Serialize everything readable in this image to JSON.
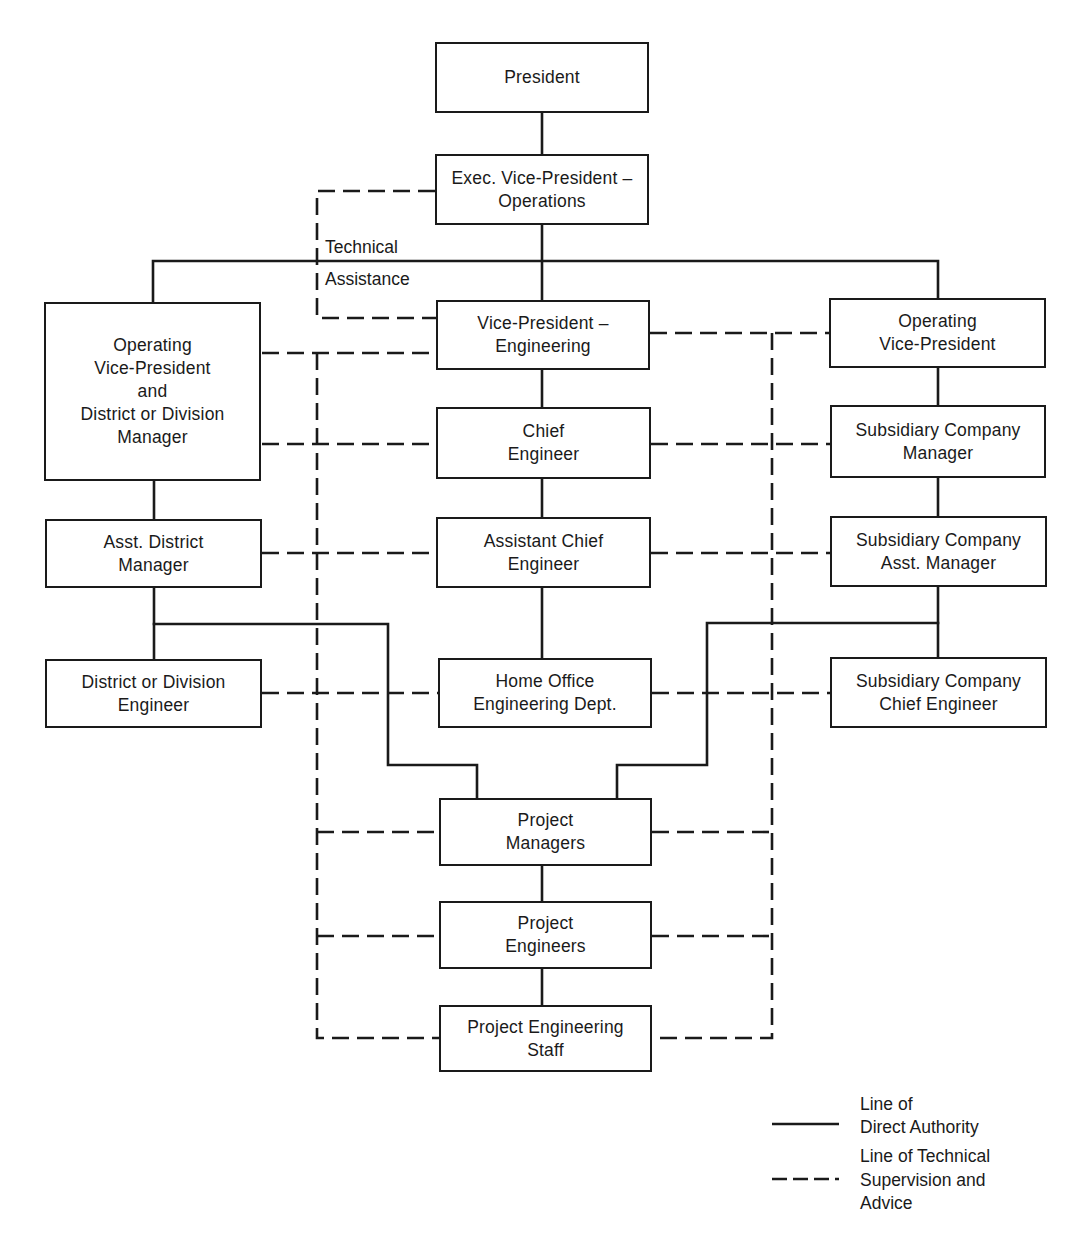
{
  "diagram": {
    "type": "organization-chart",
    "boxes": {
      "president": {
        "lines": [
          "President"
        ]
      },
      "exec_vp_operations": {
        "lines": [
          "Exec. Vice-President –",
          "Operations"
        ]
      },
      "vp_engineering": {
        "lines": [
          "Vice-President –",
          "Engineering"
        ]
      },
      "chief_engineer": {
        "lines": [
          "Chief",
          "Engineer"
        ]
      },
      "assistant_chief_engineer": {
        "lines": [
          "Assistant Chief",
          "Engineer"
        ]
      },
      "home_office_engineering": {
        "lines": [
          "Home Office",
          "Engineering Dept."
        ]
      },
      "project_managers": {
        "lines": [
          "Project",
          "Managers"
        ]
      },
      "project_engineers": {
        "lines": [
          "Project",
          "Engineers"
        ]
      },
      "project_engineering_staff": {
        "lines": [
          "Project Engineering",
          "Staff"
        ]
      },
      "operating_vp_district_manager": {
        "lines": [
          "Operating",
          "Vice-President",
          "and",
          "District or Division",
          "Manager"
        ]
      },
      "asst_district_manager": {
        "lines": [
          "Asst. District",
          "Manager"
        ]
      },
      "district_division_engineer": {
        "lines": [
          "District or Division",
          "Engineer"
        ]
      },
      "operating_vp": {
        "lines": [
          "Operating",
          "Vice-President"
        ]
      },
      "subsidiary_company_manager": {
        "lines": [
          "Subsidiary Company",
          "Manager"
        ]
      },
      "subsidiary_company_asst_manager": {
        "lines": [
          "Subsidiary Company",
          "Asst. Manager"
        ]
      },
      "subsidiary_company_chief_engineer": {
        "lines": [
          "Subsidiary Company",
          "Chief Engineer"
        ]
      }
    },
    "annotations": {
      "technical_assistance": [
        "Technical",
        "Assistance"
      ]
    },
    "legend": {
      "direct_authority": {
        "lines": [
          "Line of",
          "Direct Authority"
        ],
        "style": "solid"
      },
      "technical_supervision": {
        "lines": [
          "Line of Technical",
          "Supervision and",
          "Advice"
        ],
        "style": "dashed"
      }
    },
    "colors": {
      "line": "#1a1a1a",
      "background": "#ffffff"
    },
    "direct_authority_links": [
      [
        "President",
        "Exec. Vice-President – Operations"
      ],
      [
        "Exec. Vice-President – Operations",
        "Vice-President – Engineering"
      ],
      [
        "Exec. Vice-President – Operations",
        "Operating Vice-President and District or Division Manager"
      ],
      [
        "Exec. Vice-President – Operations",
        "Operating Vice-President"
      ],
      [
        "Vice-President – Engineering",
        "Chief Engineer"
      ],
      [
        "Chief Engineer",
        "Assistant Chief Engineer"
      ],
      [
        "Assistant Chief Engineer",
        "Home Office Engineering Dept."
      ],
      [
        "Operating Vice-President and District or Division Manager",
        "Asst. District Manager"
      ],
      [
        "Asst. District Manager",
        "District or Division Engineer"
      ],
      [
        "Asst. District Manager",
        "Project Managers"
      ],
      [
        "Operating Vice-President",
        "Subsidiary Company Manager"
      ],
      [
        "Subsidiary Company Manager",
        "Subsidiary Company Asst. Manager"
      ],
      [
        "Subsidiary Company Asst. Manager",
        "Subsidiary Company Chief Engineer"
      ],
      [
        "Subsidiary Company Asst. Manager",
        "Project Managers"
      ],
      [
        "Project Managers",
        "Project Engineers"
      ],
      [
        "Project Engineers",
        "Project Engineering Staff"
      ]
    ],
    "technical_supervision_links": [
      [
        "Exec. Vice-President – Operations",
        "Vice-President – Engineering"
      ],
      [
        "Vice-President – Engineering",
        "Operating Vice-President and District or Division Manager"
      ],
      [
        "Vice-President – Engineering",
        "Operating Vice-President"
      ],
      [
        "Chief Engineer",
        "Operating Vice-President and District or Division Manager"
      ],
      [
        "Chief Engineer",
        "Subsidiary Company Manager"
      ],
      [
        "Assistant Chief Engineer",
        "Asst. District Manager"
      ],
      [
        "Assistant Chief Engineer",
        "Subsidiary Company Asst. Manager"
      ],
      [
        "Home Office Engineering Dept.",
        "District or Division Engineer"
      ],
      [
        "Home Office Engineering Dept.",
        "Subsidiary Company Chief Engineer"
      ],
      [
        "Vice-President – Engineering",
        "Project Managers"
      ],
      [
        "Vice-President – Engineering",
        "Project Engineers"
      ],
      [
        "Vice-President – Engineering",
        "Project Engineering Staff"
      ]
    ]
  }
}
